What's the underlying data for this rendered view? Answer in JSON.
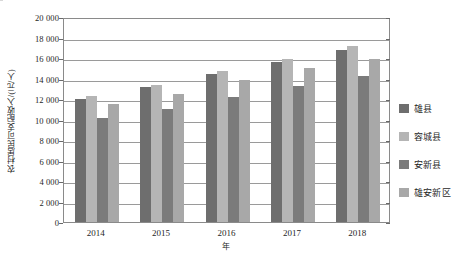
{
  "chart_data": {
    "type": "bar",
    "title": "",
    "subtitle": "",
    "xlabel": "年",
    "ylabel": "农村居民可支配收入/(元/人)",
    "categories": [
      "2014",
      "2015",
      "2016",
      "2017",
      "2018"
    ],
    "ylim": [
      0,
      20000
    ],
    "ytick_step": 2000,
    "ytick_labels": [
      "0",
      "2 000",
      "4 000",
      "6 000",
      "8 000",
      "10 000",
      "12 000",
      "14 000",
      "16 000",
      "18 000",
      "20 000"
    ],
    "ytick_values": [
      0,
      2000,
      4000,
      6000,
      8000,
      10000,
      12000,
      14000,
      16000,
      18000,
      20000
    ],
    "grid": true,
    "legend_position": "right",
    "series": [
      {
        "name": "雄县",
        "color": "#6e6e6e",
        "values": [
          12000,
          13150,
          14400,
          15650,
          16750
        ]
      },
      {
        "name": "容城县",
        "color": "#b5b5b5",
        "values": [
          12250,
          13400,
          14750,
          15950,
          17200
        ]
      },
      {
        "name": "安新县",
        "color": "#7b7b7b",
        "values": [
          10150,
          11050,
          12200,
          13300,
          14250
        ]
      },
      {
        "name": "雄安新区",
        "color": "#a8a8a8",
        "values": [
          11500,
          12500,
          13850,
          15000,
          15900
        ]
      }
    ]
  },
  "legend": {
    "items": [
      {
        "label": "雄县",
        "color": "#6e6e6e"
      },
      {
        "label": "容城县",
        "color": "#b5b5b5"
      },
      {
        "label": "安新县",
        "color": "#7b7b7b"
      },
      {
        "label": "雄安新区",
        "color": "#a8a8a8"
      }
    ]
  },
  "axes": {
    "y_title": "农村居民可支配收入/(元/人)",
    "x_title": "年"
  }
}
